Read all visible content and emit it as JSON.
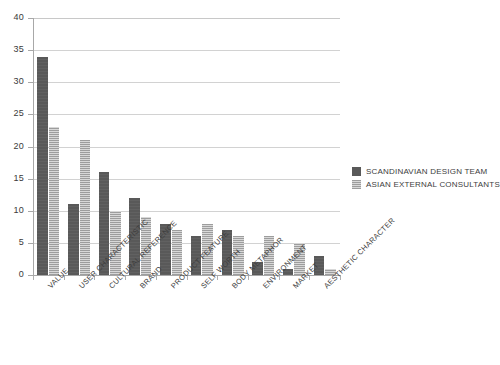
{
  "chart_data": {
    "type": "bar",
    "title": "",
    "subtitle": "",
    "xlabel": "",
    "ylabel": "",
    "ylim": [
      0,
      40
    ],
    "ytick_step": 5,
    "yticks": [
      0,
      5,
      10,
      15,
      20,
      25,
      30,
      35,
      40
    ],
    "grid": true,
    "grid_axis": "y",
    "legend_position": "right",
    "categories": [
      "VALUE",
      "USER CHARACTERISTIC",
      "CULTURAL REFERENCE",
      "BRAND",
      "PRODUCT FEATURE",
      "SELF WORTH",
      "BODY METAPHOR",
      "ENVIRONMENT",
      "MARKET",
      "AESTHETIC CHARACTER"
    ],
    "series": [
      {
        "name": "SCANDINAVIAN DESIGN TEAM",
        "color": "#595959",
        "pattern": "solid",
        "values": [
          34,
          11,
          16,
          12,
          8,
          6,
          7,
          2,
          1,
          3
        ]
      },
      {
        "name": "ASIAN EXTERNAL CONSULTANTS",
        "color": "#bdbdbd",
        "pattern": "cross-hatch",
        "values": [
          23,
          21,
          10,
          9,
          7,
          8,
          6,
          6,
          5,
          1
        ]
      }
    ]
  },
  "axis": {
    "y_tick_labels": [
      "0",
      "5",
      "10",
      "15",
      "20",
      "25",
      "30",
      "35",
      "40"
    ]
  },
  "legend": {
    "entries": [
      {
        "label": "SCANDINAVIAN DESIGN TEAM"
      },
      {
        "label": "ASIAN EXTERNAL CONSULTANTS"
      }
    ]
  }
}
